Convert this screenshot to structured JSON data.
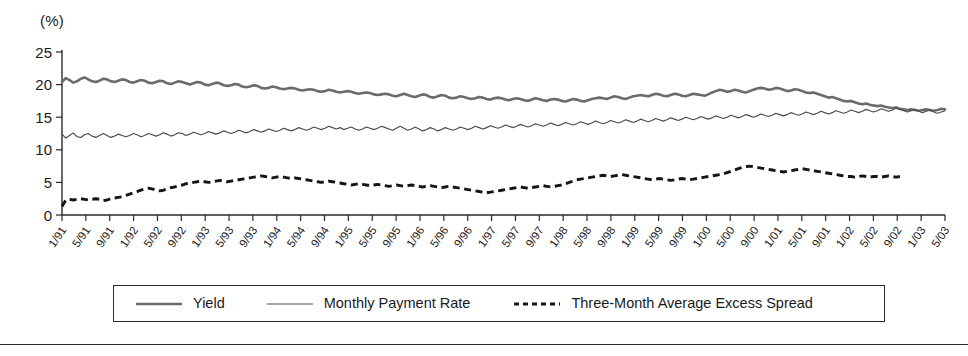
{
  "figure": {
    "unit_label": "(%)",
    "background_color": "#ffffff"
  },
  "legend": {
    "position": "bottom-center",
    "entries": [
      {
        "label": "Yield",
        "style": "solid-thick",
        "color": "#6b6b6b"
      },
      {
        "label": "Monthly Payment Rate",
        "style": "solid-thin",
        "color": "#4a4a4a"
      },
      {
        "label": "Three-Month Average Excess Spread",
        "style": "dashed",
        "color": "#151515"
      }
    ]
  },
  "chart_data": {
    "type": "line",
    "title": "",
    "subtitle": "",
    "xlabel": "",
    "ylabel": "(%)",
    "ylim": [
      0,
      25
    ],
    "yticks": [
      0,
      5,
      10,
      15,
      20,
      25
    ],
    "grid": false,
    "legend_position": "bottom",
    "x_tick_labels": [
      "1/91",
      "5/91",
      "9/91",
      "1/92",
      "5/92",
      "9/92",
      "1/93",
      "5/93",
      "9/93",
      "1/94",
      "5/94",
      "9/94",
      "1/95",
      "5/95",
      "9/95",
      "1/96",
      "5/96",
      "9/96",
      "1/97",
      "5/97",
      "9/97",
      "1/98",
      "5/98",
      "9/98",
      "1/99",
      "5/99",
      "9/99",
      "1/00",
      "5/00",
      "9/00",
      "1/01",
      "5/01",
      "9/01",
      "1/02",
      "5/02",
      "9/02",
      "1/03",
      "5/03"
    ],
    "x_tick_interval_months": 4,
    "x_start": "1/91",
    "x_end": "5/03",
    "series": [
      {
        "name": "Yield",
        "color": "#6b6b6b",
        "style": "solid-thick",
        "values": [
          20.4,
          21.0,
          20.7,
          20.3,
          20.5,
          20.9,
          21.1,
          20.8,
          20.5,
          20.4,
          20.6,
          20.9,
          20.8,
          20.5,
          20.4,
          20.6,
          20.8,
          20.7,
          20.4,
          20.3,
          20.5,
          20.7,
          20.6,
          20.3,
          20.2,
          20.4,
          20.6,
          20.5,
          20.2,
          20.1,
          20.3,
          20.5,
          20.4,
          20.2,
          20.0,
          20.2,
          20.4,
          20.3,
          20.0,
          19.9,
          20.1,
          20.3,
          20.2,
          19.9,
          19.8,
          19.9,
          20.1,
          20.0,
          19.7,
          19.6,
          19.7,
          19.9,
          19.8,
          19.5,
          19.4,
          19.5,
          19.7,
          19.6,
          19.4,
          19.3,
          19.4,
          19.5,
          19.4,
          19.2,
          19.1,
          19.2,
          19.3,
          19.2,
          19.0,
          18.9,
          19.0,
          19.2,
          19.1,
          18.9,
          18.8,
          18.9,
          19.0,
          18.9,
          18.7,
          18.6,
          18.7,
          18.8,
          18.7,
          18.5,
          18.4,
          18.5,
          18.6,
          18.5,
          18.3,
          18.2,
          18.4,
          18.6,
          18.4,
          18.2,
          18.1,
          18.3,
          18.5,
          18.4,
          18.1,
          18.0,
          18.2,
          18.4,
          18.3,
          18.0,
          17.9,
          18.0,
          18.2,
          18.1,
          17.9,
          17.8,
          17.9,
          18.1,
          18.0,
          17.8,
          17.7,
          17.9,
          18.0,
          17.9,
          17.7,
          17.6,
          17.8,
          17.9,
          17.8,
          17.6,
          17.5,
          17.7,
          17.9,
          17.8,
          17.6,
          17.5,
          17.7,
          17.8,
          17.7,
          17.5,
          17.4,
          17.6,
          17.8,
          17.7,
          17.5,
          17.4,
          17.6,
          17.8,
          17.9,
          18.0,
          17.9,
          17.8,
          18.0,
          18.2,
          18.1,
          17.9,
          17.8,
          18.0,
          18.2,
          18.3,
          18.4,
          18.3,
          18.2,
          18.4,
          18.6,
          18.5,
          18.3,
          18.2,
          18.4,
          18.6,
          18.5,
          18.3,
          18.2,
          18.4,
          18.6,
          18.5,
          18.4,
          18.3,
          18.5,
          18.8,
          19.0,
          19.2,
          19.1,
          18.9,
          19.0,
          19.2,
          19.1,
          18.9,
          18.8,
          19.0,
          19.2,
          19.4,
          19.5,
          19.4,
          19.2,
          19.3,
          19.5,
          19.4,
          19.2,
          19.0,
          19.1,
          19.3,
          19.2,
          19.0,
          18.8,
          18.7,
          18.8,
          18.6,
          18.4,
          18.2,
          18.0,
          18.1,
          17.9,
          17.7,
          17.5,
          17.4,
          17.5,
          17.3,
          17.1,
          17.0,
          17.1,
          16.9,
          16.8,
          16.7,
          16.8,
          16.6,
          16.5,
          16.4,
          16.5,
          16.3,
          16.2,
          16.1,
          16.2,
          16.1,
          16.0,
          16.1,
          16.2,
          16.1,
          16.0,
          16.1,
          16.3,
          16.2
        ]
      },
      {
        "name": "Monthly Payment Rate",
        "color": "#4a4a4a",
        "style": "solid-thin",
        "values": [
          12.4,
          11.8,
          12.2,
          12.6,
          12.0,
          11.9,
          12.3,
          12.5,
          12.1,
          11.9,
          12.2,
          12.5,
          12.2,
          11.9,
          12.1,
          12.4,
          12.2,
          12.0,
          12.2,
          12.5,
          12.3,
          12.0,
          12.2,
          12.5,
          12.3,
          12.1,
          12.3,
          12.6,
          12.4,
          12.1,
          12.3,
          12.6,
          12.5,
          12.2,
          12.4,
          12.7,
          12.5,
          12.3,
          12.5,
          12.8,
          12.6,
          12.4,
          12.6,
          12.9,
          12.7,
          12.5,
          12.7,
          13.0,
          12.8,
          12.6,
          12.8,
          13.1,
          12.9,
          12.7,
          12.9,
          13.2,
          13.0,
          12.8,
          13.0,
          13.3,
          13.1,
          12.9,
          13.1,
          13.4,
          13.2,
          13.0,
          13.2,
          13.5,
          13.3,
          13.1,
          13.3,
          13.6,
          13.4,
          13.2,
          13.4,
          13.1,
          13.3,
          13.5,
          13.2,
          13.0,
          13.2,
          13.5,
          13.3,
          13.1,
          13.3,
          13.6,
          13.4,
          13.2,
          13.0,
          13.3,
          13.6,
          13.3,
          13.0,
          13.2,
          13.5,
          13.2,
          12.9,
          13.1,
          13.4,
          13.2,
          12.9,
          13.1,
          13.4,
          13.2,
          13.0,
          13.2,
          13.5,
          13.3,
          13.1,
          13.3,
          13.6,
          13.4,
          13.2,
          13.4,
          13.7,
          13.5,
          13.3,
          13.5,
          13.8,
          13.6,
          13.4,
          13.6,
          13.9,
          13.7,
          13.5,
          13.7,
          14.0,
          13.8,
          13.6,
          13.8,
          14.1,
          13.9,
          13.7,
          13.9,
          14.2,
          14.0,
          13.8,
          14.0,
          14.3,
          14.1,
          13.9,
          14.1,
          14.4,
          14.2,
          14.0,
          14.2,
          14.5,
          14.3,
          14.1,
          14.3,
          14.6,
          14.4,
          14.2,
          14.4,
          14.7,
          14.5,
          14.3,
          14.5,
          14.8,
          14.6,
          14.4,
          14.6,
          14.9,
          14.7,
          14.5,
          14.7,
          15.0,
          14.8,
          14.6,
          14.8,
          15.1,
          14.9,
          14.7,
          14.9,
          15.2,
          15.0,
          14.8,
          15.0,
          15.3,
          15.1,
          14.9,
          15.1,
          15.4,
          15.2,
          15.0,
          15.2,
          15.5,
          15.3,
          15.1,
          15.3,
          15.6,
          15.4,
          15.2,
          15.4,
          15.7,
          15.5,
          15.3,
          15.5,
          15.8,
          15.6,
          15.4,
          15.6,
          15.9,
          15.7,
          15.5,
          15.7,
          16.0,
          15.8,
          15.6,
          15.8,
          16.1,
          15.9,
          15.7,
          15.9,
          16.2,
          16.0,
          15.8,
          16.0,
          16.3,
          16.1,
          15.9,
          16.1,
          16.4,
          16.2,
          16.0,
          15.8,
          16.0,
          16.2,
          15.9,
          15.7,
          15.9,
          16.1,
          15.8,
          15.6,
          15.8,
          16.0
        ]
      },
      {
        "name": "Three-Month Average Excess Spread",
        "color": "#151515",
        "style": "dashed",
        "values": [
          1.3,
          2.3,
          2.4,
          2.3,
          2.4,
          2.5,
          2.4,
          2.3,
          2.4,
          2.5,
          2.4,
          2.2,
          2.3,
          2.5,
          2.6,
          2.7,
          2.8,
          3.0,
          3.2,
          3.4,
          3.6,
          3.8,
          4.0,
          4.1,
          4.0,
          3.8,
          3.7,
          3.8,
          4.0,
          4.2,
          4.3,
          4.5,
          4.6,
          4.8,
          4.9,
          5.0,
          5.1,
          5.2,
          5.1,
          5.0,
          5.1,
          5.2,
          5.3,
          5.2,
          5.1,
          5.2,
          5.3,
          5.4,
          5.5,
          5.6,
          5.7,
          5.8,
          5.9,
          6.0,
          5.9,
          5.8,
          5.7,
          5.8,
          5.9,
          5.8,
          5.7,
          5.6,
          5.7,
          5.6,
          5.5,
          5.4,
          5.3,
          5.2,
          5.1,
          5.0,
          5.1,
          5.2,
          5.1,
          5.0,
          4.9,
          4.8,
          4.7,
          4.6,
          4.7,
          4.8,
          4.7,
          4.6,
          4.5,
          4.6,
          4.7,
          4.6,
          4.5,
          4.4,
          4.5,
          4.6,
          4.5,
          4.4,
          4.5,
          4.6,
          4.5,
          4.4,
          4.3,
          4.4,
          4.5,
          4.4,
          4.3,
          4.2,
          4.3,
          4.4,
          4.3,
          4.2,
          4.1,
          4.0,
          3.9,
          3.8,
          3.7,
          3.6,
          3.5,
          3.4,
          3.5,
          3.6,
          3.7,
          3.8,
          3.9,
          4.0,
          4.1,
          4.2,
          4.3,
          4.2,
          4.1,
          4.2,
          4.3,
          4.4,
          4.5,
          4.4,
          4.3,
          4.4,
          4.5,
          4.6,
          4.8,
          5.0,
          5.2,
          5.4,
          5.5,
          5.6,
          5.7,
          5.8,
          5.9,
          6.0,
          6.1,
          6.0,
          5.9,
          6.0,
          6.1,
          6.2,
          6.1,
          6.0,
          5.9,
          5.8,
          5.7,
          5.6,
          5.5,
          5.4,
          5.5,
          5.6,
          5.5,
          5.4,
          5.3,
          5.4,
          5.5,
          5.6,
          5.5,
          5.4,
          5.5,
          5.6,
          5.7,
          5.8,
          5.9,
          6.0,
          6.1,
          6.2,
          6.3,
          6.5,
          6.7,
          6.9,
          7.1,
          7.3,
          7.4,
          7.5,
          7.4,
          7.3,
          7.2,
          7.1,
          7.0,
          6.9,
          6.8,
          6.7,
          6.6,
          6.7,
          6.8,
          6.9,
          7.0,
          7.1,
          7.0,
          6.9,
          6.8,
          6.7,
          6.6,
          6.5,
          6.4,
          6.3,
          6.2,
          6.1,
          6.0,
          5.9,
          5.9,
          5.8,
          5.9,
          6.0,
          5.9,
          5.8,
          5.9,
          5.9,
          5.8,
          5.9,
          6.0,
          5.9,
          5.8,
          5.9
        ]
      }
    ]
  }
}
